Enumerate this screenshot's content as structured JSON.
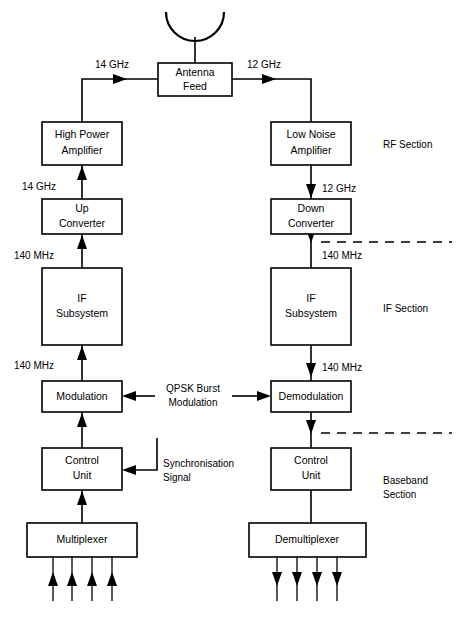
{
  "diagram": {
    "blocks": [
      {
        "id": "antenna_feed",
        "label_line1": "Antenna",
        "label_line2": "Feed"
      },
      {
        "id": "high_power_amp",
        "label_line1": "High Power",
        "label_line2": "Amplifier"
      },
      {
        "id": "low_noise_amp",
        "label_line1": "Low Noise",
        "label_line2": "Amplifier"
      },
      {
        "id": "up_converter",
        "label_line1": "Up",
        "label_line2": "Converter"
      },
      {
        "id": "down_converter",
        "label_line1": "Down",
        "label_line2": "Converter"
      },
      {
        "id": "if_subsystem_tx",
        "label_line1": "IF",
        "label_line2": "Subsystem"
      },
      {
        "id": "if_subsystem_rx",
        "label_line1": "IF",
        "label_line2": "Subsystem"
      },
      {
        "id": "modulation",
        "label_line1": "Modulation",
        "label_line2": ""
      },
      {
        "id": "demodulation",
        "label_line1": "Demodulation",
        "label_line2": ""
      },
      {
        "id": "control_unit_tx",
        "label_line1": "Control",
        "label_line2": "Unit"
      },
      {
        "id": "control_unit_rx",
        "label_line1": "Control",
        "label_line2": "Unit"
      },
      {
        "id": "multiplexer",
        "label_line1": "Multiplexer",
        "label_line2": ""
      },
      {
        "id": "demultiplexer",
        "label_line1": "Demultiplexer",
        "label_line2": ""
      }
    ],
    "edge_labels": {
      "tx_antenna_freq": "14 GHz",
      "rx_antenna_freq": "12 GHz",
      "tx_upconv_freq": "14 GHz",
      "rx_downconv_freq": "12 GHz",
      "tx_if_upper_freq": "140 MHz",
      "rx_if_upper_freq": "140 MHz",
      "tx_if_lower_freq": "140 MHz",
      "rx_if_lower_freq": "140 MHz",
      "qpsk_line1": "QPSK Burst",
      "qpsk_line2": "Modulation",
      "sync_line1": "Synchronisation",
      "sync_line2": "Signal"
    },
    "sections": {
      "rf": "RF Section",
      "if": "IF Section",
      "baseband_line1": "Baseband",
      "baseband_line2": "Section"
    },
    "colors": {
      "line": "#000000",
      "fill": "#ffffff",
      "background": "#ffffff"
    },
    "tributary_counts": {
      "multiplexer_inputs": 4,
      "demultiplexer_outputs": 4
    }
  }
}
